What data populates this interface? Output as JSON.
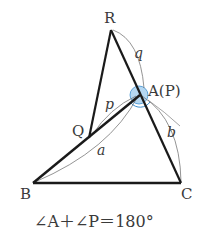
{
  "diagram": {
    "labels": {
      "R": "R",
      "Q": "Q",
      "A": "A(P)",
      "B": "B",
      "C": "C",
      "p": "p",
      "q": "q",
      "a": "a",
      "b": "b"
    },
    "equation": "∠A＋∠P＝180°",
    "colors": {
      "line": "#1a1a1a",
      "arc": "#555555",
      "angle_fill": "#8fc3ea",
      "angle_stroke": "#3d8fd0"
    }
  }
}
